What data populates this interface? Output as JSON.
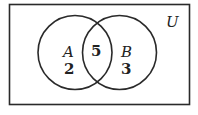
{
  "diagram": {
    "type": "venn",
    "universe_label": "U",
    "sets": [
      {
        "label": "A",
        "only_count": "2"
      },
      {
        "label": "B",
        "only_count": "3"
      }
    ],
    "intersection_count": "5",
    "colors": {
      "stroke": "#2a2a2a",
      "background": "#ffffff",
      "text": "#222222"
    }
  }
}
